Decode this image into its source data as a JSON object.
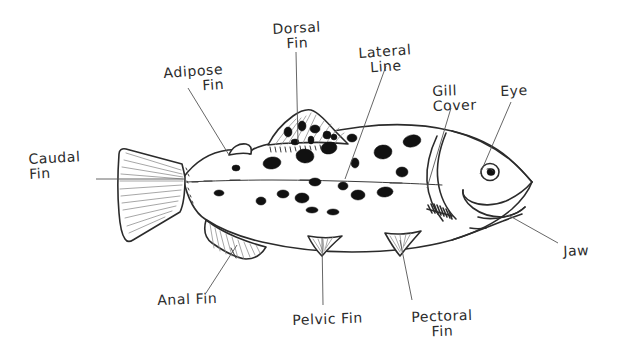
{
  "diagram": {
    "style": "hand-drawn pen sketch",
    "background_color": "#ffffff",
    "ink_color": "#2b2b2b",
    "spot_color": "#111111",
    "width": 631,
    "height": 361
  },
  "labels": [
    {
      "id": "caudal-fin",
      "line1": "Caudal",
      "line2": "Fin",
      "align": "left",
      "x": 28,
      "y": 152,
      "rotate": -3
    },
    {
      "id": "adipose-fin",
      "line1": "Adipose",
      "line2": "Fin",
      "align": "right",
      "x": 163,
      "y": 66,
      "rotate": -4
    },
    {
      "id": "dorsal-fin",
      "line1": "Dorsal",
      "line2": "Fin",
      "align": "center",
      "x": 272,
      "y": 22,
      "rotate": -3
    },
    {
      "id": "lateral-line",
      "line1": "Lateral",
      "line2": "Line",
      "align": "center",
      "x": 358,
      "y": 46,
      "rotate": -4
    },
    {
      "id": "gill-cover",
      "line1": "Gill",
      "line2": "Cover",
      "align": "center",
      "x": 432,
      "y": 84,
      "rotate": -2
    },
    {
      "id": "eye",
      "line1": "Eye",
      "line2": "",
      "align": "left",
      "x": 500,
      "y": 84,
      "rotate": -2
    },
    {
      "id": "jaw",
      "line1": "Jaw",
      "line2": "",
      "align": "left",
      "x": 563,
      "y": 244,
      "rotate": -2
    },
    {
      "id": "pectoral-fin",
      "line1": "Pectoral",
      "line2": "Fin",
      "align": "center",
      "x": 411,
      "y": 310,
      "rotate": -2
    },
    {
      "id": "pelvic-fin",
      "line1": "Pelvic Fin",
      "line2": "",
      "align": "left",
      "x": 292,
      "y": 313,
      "rotate": -2
    },
    {
      "id": "anal-fin",
      "line1": "Anal Fin",
      "line2": "",
      "align": "left",
      "x": 157,
      "y": 293,
      "rotate": -2
    }
  ],
  "leader_lines": [
    {
      "id": "caudal-fin-leader",
      "x1": 96,
      "y1": 179,
      "x2": 184,
      "y2": 179
    },
    {
      "id": "adipose-fin-leader",
      "x1": 188,
      "y1": 88,
      "x2": 229,
      "y2": 155
    },
    {
      "id": "dorsal-fin-leader",
      "x1": 296,
      "y1": 52,
      "x2": 298,
      "y2": 143
    },
    {
      "id": "lateral-line-leader",
      "x1": 386,
      "y1": 66,
      "x2": 345,
      "y2": 179
    },
    {
      "id": "gill-cover-leader",
      "x1": 451,
      "y1": 108,
      "x2": 427,
      "y2": 188
    },
    {
      "id": "eye-leader",
      "x1": 511,
      "y1": 102,
      "x2": 480,
      "y2": 174
    },
    {
      "id": "jaw-leader",
      "x1": 558,
      "y1": 243,
      "x2": 508,
      "y2": 215
    },
    {
      "id": "pectoral-fin-leader",
      "x1": 412,
      "y1": 300,
      "x2": 400,
      "y2": 240
    },
    {
      "id": "pelvic-fin-leader",
      "x1": 323,
      "y1": 305,
      "x2": 322,
      "y2": 238
    },
    {
      "id": "anal-fin-leader",
      "x1": 206,
      "y1": 293,
      "x2": 237,
      "y2": 245
    }
  ],
  "parts": [
    {
      "id": "body",
      "name": "fish body"
    },
    {
      "id": "caudal-fin",
      "name": "caudal fin"
    },
    {
      "id": "adipose-fin",
      "name": "adipose fin"
    },
    {
      "id": "dorsal-fin",
      "name": "dorsal fin"
    },
    {
      "id": "anal-fin",
      "name": "anal fin"
    },
    {
      "id": "pelvic-fin",
      "name": "pelvic fin"
    },
    {
      "id": "pectoral-fin",
      "name": "pectoral fin"
    },
    {
      "id": "gill-cover",
      "name": "gill cover"
    },
    {
      "id": "eye",
      "name": "eye"
    },
    {
      "id": "jaw",
      "name": "jaw"
    },
    {
      "id": "lateral-line",
      "name": "lateral line"
    }
  ]
}
